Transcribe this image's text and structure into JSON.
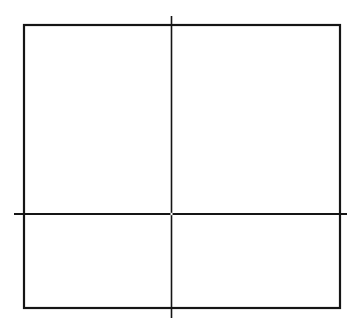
{
  "canvas": {
    "width": 361,
    "height": 330,
    "background": "#ffffff"
  },
  "colors": {
    "stroke": "#151515",
    "gap": "#ffffff"
  },
  "diagram": {
    "rectangle": {
      "x": 24,
      "y": 25,
      "width": 316,
      "height": 283,
      "stroke_width": 2.2
    },
    "lines": [
      {
        "name": "vertical-divider-line",
        "x1": 171.5,
        "y1": 16,
        "x2": 171.5,
        "y2": 318,
        "stroke_width": 1.6
      },
      {
        "name": "horizontal-divider-line",
        "x1": 14,
        "y1": 214,
        "x2": 347,
        "y2": 214,
        "stroke_width": 2.2
      }
    ],
    "intersection_gap": {
      "cx": 171.5,
      "cy": 214,
      "r": 1.2
    }
  }
}
